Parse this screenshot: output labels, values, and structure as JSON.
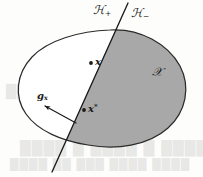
{
  "figure": {
    "type": "separating-hyperplane-diagram",
    "caption_text": "",
    "colors": {
      "shaded_halfspace_fill": "#a8a8a8",
      "unshaded_halfspace_fill": "#ffffff",
      "outline_stroke": "#2b2b2b",
      "hyperplane_stroke": "#1a1a1a",
      "label_color": "#1a1a1a",
      "background": "#fdfdfc"
    },
    "labels": {
      "halfspace_positive": "ℋ",
      "halfspace_positive_sub": "+",
      "halfspace_negative": "ℋ",
      "halfspace_negative_sub": "−",
      "convex_set": "𝒳",
      "point_x": "x",
      "point_x_star": "x",
      "point_x_star_sup": "*",
      "gradient": "g",
      "gradient_sub": "x"
    }
  },
  "bleed_through": {
    "line_1": "███ ██████ ██",
    "line_2": "███",
    "line_3": "████ █ ████ █ ████",
    "line_4": "████ ██ ███ ████   ████"
  }
}
